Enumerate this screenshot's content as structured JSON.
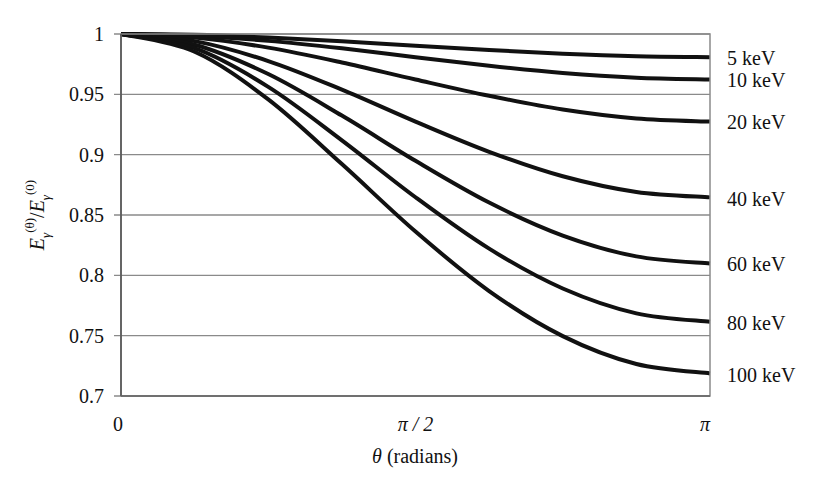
{
  "chart_data": {
    "type": "line",
    "title": "",
    "xlabel": "θ (radians)",
    "ylabel": "E_γ^(θ)/E_γ^(0)",
    "xlim": [
      0,
      3.14159
    ],
    "ylim": [
      0.7,
      1.0
    ],
    "x_ticks": [
      {
        "value": 0,
        "label": "0"
      },
      {
        "value": 1.5708,
        "label": "π / 2"
      },
      {
        "value": 3.14159,
        "label": "π"
      }
    ],
    "y_ticks": [
      {
        "value": 1.0,
        "label": "1"
      },
      {
        "value": 0.95,
        "label": "0.95"
      },
      {
        "value": 0.9,
        "label": "0.9"
      },
      {
        "value": 0.85,
        "label": "0.85"
      },
      {
        "value": 0.8,
        "label": "0.8"
      },
      {
        "value": 0.75,
        "label": "0.75"
      },
      {
        "value": 0.7,
        "label": "0.7"
      }
    ],
    "grid": {
      "horizontal": true,
      "vertical": false
    },
    "legend": "inline labels at right end of curves",
    "x": [
      0,
      0.3927,
      0.7854,
      1.1781,
      1.5708,
      1.9635,
      2.3562,
      2.7489,
      3.14159
    ],
    "series": [
      {
        "name": "5 keV",
        "values": [
          1,
          0.9993,
          0.9971,
          0.994,
          0.9903,
          0.9867,
          0.9836,
          0.9815,
          0.9808
        ]
      },
      {
        "name": "10 keV",
        "values": [
          1,
          0.9985,
          0.9943,
          0.9881,
          0.9808,
          0.9737,
          0.9677,
          0.9638,
          0.9623
        ]
      },
      {
        "name": "20 keV",
        "values": [
          1,
          0.997,
          0.9887,
          0.9764,
          0.9623,
          0.9488,
          0.9374,
          0.93,
          0.9274
        ]
      },
      {
        "name": "40 keV",
        "values": [
          1,
          0.9941,
          0.9776,
          0.9539,
          0.9274,
          0.9024,
          0.8821,
          0.8691,
          0.8646
        ]
      },
      {
        "name": "60 keV",
        "values": [
          1,
          0.9911,
          0.9668,
          0.9324,
          0.8949,
          0.8603,
          0.833,
          0.8157,
          0.8098
        ]
      },
      {
        "name": "80 keV",
        "values": [
          1,
          0.9882,
          0.9562,
          0.9119,
          0.8647,
          0.8221,
          0.7891,
          0.7685,
          0.7615
        ]
      },
      {
        "name": "100 keV",
        "values": [
          1,
          0.9853,
          0.9458,
          0.8922,
          0.8363,
          0.787,
          0.7496,
          0.7265,
          0.7187
        ]
      }
    ],
    "series_label_y": [
      58,
      80,
      122,
      199,
      264,
      323,
      375
    ],
    "colors": {
      "line": "#111111",
      "grid": "#8a8a8a",
      "axis": "#777777"
    }
  }
}
